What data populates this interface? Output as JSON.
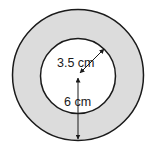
{
  "diagram": {
    "type": "annulus",
    "colors": {
      "ring_fill": "#dcdcdc",
      "inner_fill": "#ffffff",
      "stroke": "#1a1a1a"
    },
    "inner_radius_label": "3.5 cm",
    "outer_radius_label": "6 cm"
  }
}
